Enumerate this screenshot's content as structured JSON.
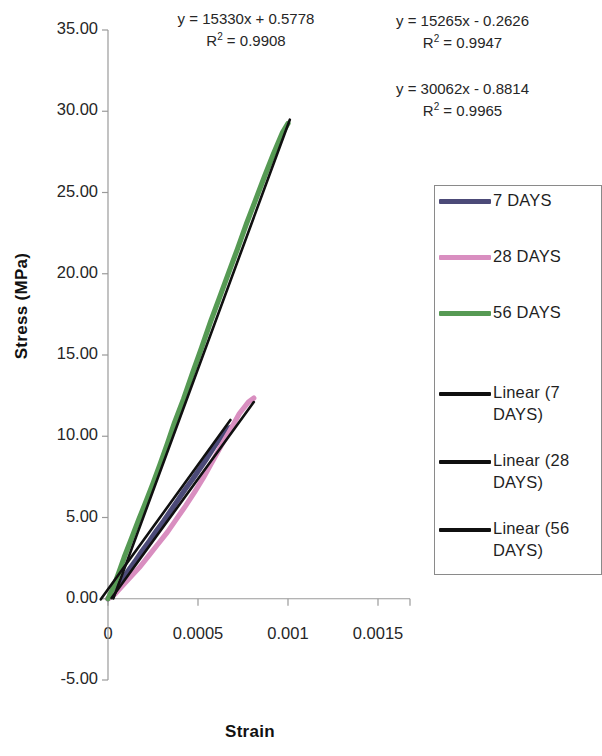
{
  "chart_data": {
    "type": "line",
    "title": "",
    "xlabel": "Strain",
    "ylabel": "Stress (MPa)",
    "xlim": [
      0,
      0.00175
    ],
    "ylim": [
      -5,
      35
    ],
    "grid": false,
    "legend_position": "right",
    "xticks": [
      "0",
      "0.0005",
      "0.001",
      "0.0015"
    ],
    "xtick_values": [
      0,
      0.0005,
      0.001,
      0.0015
    ],
    "yticks": [
      "-5.00",
      "0.00",
      "5.00",
      "10.00",
      "15.00",
      "20.00",
      "25.00",
      "30.00",
      "35.00"
    ],
    "ytick_values": [
      -5,
      0,
      5,
      10,
      15,
      20,
      25,
      30,
      35
    ],
    "series": [
      {
        "name": "7 DAYS",
        "color": "#4c4a78",
        "kind": "data",
        "points": [
          [
            0.0,
            0.0
          ],
          [
            3e-05,
            0.35
          ],
          [
            6e-05,
            0.85
          ],
          [
            9e-05,
            1.35
          ],
          [
            0.00012,
            1.85
          ],
          [
            0.00015,
            2.3
          ],
          [
            0.00019,
            2.95
          ],
          [
            0.00023,
            3.55
          ],
          [
            0.00027,
            4.2
          ],
          [
            0.00031,
            4.8
          ],
          [
            0.00035,
            5.45
          ],
          [
            0.00039,
            6.1
          ],
          [
            0.00043,
            6.75
          ],
          [
            0.00047,
            7.35
          ],
          [
            0.00051,
            8.0
          ],
          [
            0.00055,
            8.65
          ],
          [
            0.00059,
            9.35
          ],
          [
            0.00063,
            9.95
          ],
          [
            0.00066,
            10.45
          ],
          [
            0.00068,
            10.55
          ]
        ]
      },
      {
        "name": "28 DAYS",
        "color": "#d98ec0",
        "kind": "data",
        "points": [
          [
            0.0,
            0.0
          ],
          [
            4e-05,
            0.3
          ],
          [
            8e-05,
            0.8
          ],
          [
            0.00013,
            1.4
          ],
          [
            0.00018,
            2.0
          ],
          [
            0.00023,
            2.7
          ],
          [
            0.00028,
            3.4
          ],
          [
            0.00033,
            4.1
          ],
          [
            0.00038,
            4.9
          ],
          [
            0.00043,
            5.7
          ],
          [
            0.00048,
            6.55
          ],
          [
            0.00053,
            7.45
          ],
          [
            0.00058,
            8.45
          ],
          [
            0.00063,
            9.45
          ],
          [
            0.00068,
            10.4
          ],
          [
            0.00073,
            11.4
          ],
          [
            0.00078,
            12.1
          ],
          [
            0.00081,
            12.35
          ]
        ]
      },
      {
        "name": "56 DAYS",
        "color": "#569a54",
        "kind": "data",
        "points": [
          [
            0.0,
            0.0
          ],
          [
            3e-05,
            0.7
          ],
          [
            6e-05,
            1.6
          ],
          [
            9e-05,
            2.55
          ],
          [
            0.00013,
            3.7
          ],
          [
            0.00017,
            4.85
          ],
          [
            0.00021,
            5.95
          ],
          [
            0.00025,
            7.1
          ],
          [
            0.00029,
            8.3
          ],
          [
            0.00033,
            9.55
          ],
          [
            0.00037,
            10.85
          ],
          [
            0.00042,
            12.3
          ],
          [
            0.00047,
            13.9
          ],
          [
            0.00052,
            15.45
          ],
          [
            0.00057,
            17.05
          ],
          [
            0.00062,
            18.55
          ],
          [
            0.00067,
            20.05
          ],
          [
            0.00072,
            21.55
          ],
          [
            0.00077,
            23.1
          ],
          [
            0.00082,
            24.55
          ],
          [
            0.00087,
            26.0
          ],
          [
            0.00092,
            27.4
          ],
          [
            0.00097,
            28.7
          ],
          [
            0.001,
            29.25
          ]
        ]
      },
      {
        "name": "Linear (7 DAYS)",
        "color": "#101010",
        "kind": "trend",
        "equation": "y = 15330x + 0.5778",
        "slope": 15330,
        "intercept": 0.5778,
        "r2": "0.9908",
        "x_range": [
          -4e-05,
          0.00068
        ]
      },
      {
        "name": "Linear (28 DAYS)",
        "color": "#101010",
        "kind": "trend",
        "equation": "y = 15265x - 0.2626",
        "slope": 15265,
        "intercept": -0.2626,
        "r2": "0.9947",
        "x_range": [
          2e-05,
          0.00081
        ]
      },
      {
        "name": "Linear (56 DAYS)",
        "color": "#101010",
        "kind": "trend",
        "equation": "y = 30062x - 0.8814",
        "slope": 30062,
        "intercept": -0.8814,
        "r2": "0.9965",
        "x_range": [
          3e-05,
          0.00101
        ]
      }
    ]
  },
  "annotations": {
    "eq_7": {
      "line1": "y = 15330x + 0.5778",
      "r2_prefix": "R",
      "r2_value": " = 0.9908",
      "sup": "2"
    },
    "eq_28": {
      "line1": "y = 15265x - 0.2626",
      "r2_prefix": "R",
      "r2_value": " = 0.9947",
      "sup": "2"
    },
    "eq_56": {
      "line1": "y = 30062x - 0.8814",
      "r2_prefix": "R",
      "r2_value": " = 0.9965",
      "sup": "2"
    }
  },
  "axes": {
    "x_title": "Strain",
    "y_title": "Stress (MPa)",
    "x_tick_labels": [
      "0",
      "0.0005",
      "0.001",
      "0.0015"
    ],
    "y_tick_labels": [
      "35.00",
      "30.00",
      "25.00",
      "20.00",
      "15.00",
      "10.00",
      "5.00",
      "0.00",
      "-5.00"
    ]
  },
  "legend": {
    "items": [
      {
        "label": "7 DAYS",
        "color": "#4c4a78",
        "thin": false
      },
      {
        "label": "28 DAYS",
        "color": "#d98ec0",
        "thin": false
      },
      {
        "label": "56 DAYS",
        "color": "#569a54",
        "thin": false
      },
      {
        "label": "Linear (7\nDAYS)",
        "color": "#101010",
        "thin": true
      },
      {
        "label": "Linear (28\nDAYS)",
        "color": "#101010",
        "thin": true
      },
      {
        "label": "Linear (56\nDAYS)",
        "color": "#101010",
        "thin": true
      }
    ]
  },
  "colors": {
    "series_7days": "#4c4a78",
    "series_28days": "#d98ec0",
    "series_56days": "#569a54",
    "trendline": "#101010",
    "axis": "#9a9a9a",
    "text": "#1f1f1f",
    "background": "#ffffff"
  }
}
